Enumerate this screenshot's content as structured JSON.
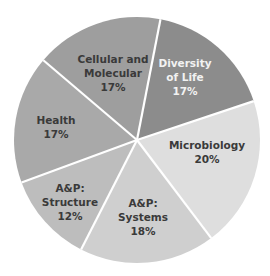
{
  "chart_data": {
    "type": "pie",
    "title": "",
    "start_angle_deg": 11,
    "direction": "clockwise",
    "slices": [
      {
        "label_lines": [
          "Diversity",
          "of Life"
        ],
        "label": "Diversity of Life",
        "value": 17,
        "value_label": "17%",
        "color": "#8c8c8c",
        "text_color": "#f2f2f2",
        "label_pos": [
          185,
          77
        ]
      },
      {
        "label_lines": [
          "Microbiology"
        ],
        "label": "Microbiology",
        "value": 20,
        "value_label": "20%",
        "color": "#dedede",
        "text_color": "#3a3a3a",
        "label_pos": [
          207,
          152
        ]
      },
      {
        "label_lines": [
          "A&P:",
          "Systems"
        ],
        "label": "A&P: Systems",
        "value": 18,
        "value_label": "18%",
        "color": "#cfcfcf",
        "text_color": "#3a3a3a",
        "label_pos": [
          143,
          217
        ]
      },
      {
        "label_lines": [
          "A&P:",
          "Structure"
        ],
        "label": "A&P: Structure",
        "value": 12,
        "value_label": "12%",
        "color": "#bdbdbd",
        "text_color": "#3a3a3a",
        "label_pos": [
          70,
          202
        ]
      },
      {
        "label_lines": [
          "Health"
        ],
        "label": "Health",
        "value": 17,
        "value_label": "17%",
        "color": "#a9a9a9",
        "text_color": "#3a3a3a",
        "label_pos": [
          56,
          127
        ]
      },
      {
        "label_lines": [
          "Cellular and",
          "Molecular"
        ],
        "label": "Cellular and Molecular",
        "value": 17,
        "value_label": "17%",
        "color": "#9e9e9e",
        "text_color": "#3a3a3a",
        "label_pos": [
          113,
          73
        ]
      }
    ],
    "center": [
      137,
      140
    ],
    "radius": 123,
    "separator_color": "#ffffff",
    "legend": "none"
  }
}
